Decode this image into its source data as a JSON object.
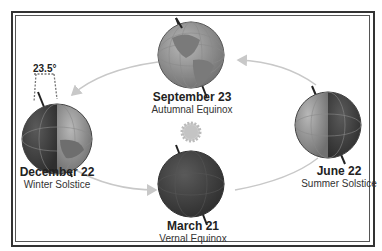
{
  "diagram": {
    "tilt_label": "23.5°",
    "positions": [
      {
        "id": "september",
        "date": "September 23",
        "event": "Autumnal Equinox"
      },
      {
        "id": "december",
        "date": "December 22",
        "event": "Winter Solstice"
      },
      {
        "id": "june",
        "date": "June 22",
        "event": "Summer Solstice"
      },
      {
        "id": "march",
        "date": "March 21",
        "event": "Vernal Equinox"
      }
    ],
    "center": "sun",
    "colors": {
      "globe_light": "#9a9a9a",
      "globe_dark": "#4a4a4a",
      "orbit": "#c8c8c8",
      "sun": "#c9c9c9",
      "frame": "#333333"
    }
  }
}
